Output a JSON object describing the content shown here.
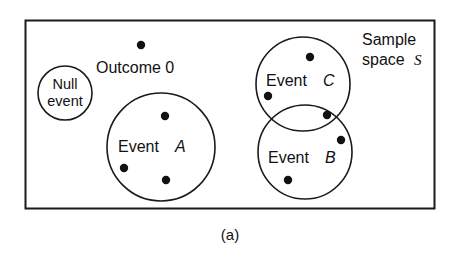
{
  "figure": {
    "caption": "(a)",
    "sample_space": {
      "label_line1": "Sample",
      "label_line2": "space",
      "symbol": "S",
      "boundary": "rectangle"
    },
    "null_event": {
      "label_line1": "Null",
      "label_line2": "event",
      "shape": "circle",
      "outcome_count": 0
    },
    "outcome_annotation": {
      "label": "Outcome 0",
      "marker": "outcome-dot"
    },
    "events": [
      {
        "id": "A",
        "label_prefix": "Event",
        "label_symbol": "A",
        "shape": "circle",
        "outcome_count": 3
      },
      {
        "id": "B",
        "label_prefix": "Event",
        "label_symbol": "B",
        "shape": "circle",
        "outcome_count": 3
      },
      {
        "id": "C",
        "label_prefix": "Event",
        "label_symbol": "C",
        "shape": "circle",
        "outcome_count": 3
      }
    ],
    "colors": {
      "stroke": "#1a1a1a",
      "dot": "#111111",
      "background": "#ffffff",
      "text": "#111111"
    }
  }
}
